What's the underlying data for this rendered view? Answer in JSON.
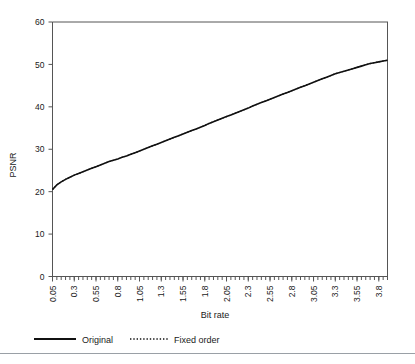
{
  "chart_data": {
    "type": "line",
    "title": "",
    "xlabel": "Bit rate",
    "ylabel": "PSNR",
    "xlim": [
      0.05,
      3.9
    ],
    "ylim": [
      0,
      60
    ],
    "ytick_values": [
      0,
      10,
      20,
      30,
      40,
      50,
      60
    ],
    "ytick_labels": [
      "0",
      "10",
      "20",
      "30",
      "40",
      "50",
      "60"
    ],
    "xtick_labels": [
      "0.05",
      "0.3",
      "0.55",
      "0.8",
      "1.05",
      "1.3",
      "1.55",
      "1.8",
      "2.05",
      "2.3",
      "2.55",
      "2.8",
      "3.05",
      "3.3",
      "3.55",
      "3.8"
    ],
    "xtick_values": [
      0.05,
      0.3,
      0.55,
      0.8,
      1.05,
      1.3,
      1.55,
      1.8,
      2.05,
      2.3,
      2.55,
      2.8,
      3.05,
      3.3,
      3.55,
      3.8
    ],
    "minor_tick_step": 0.05,
    "grid": false,
    "legend_position": "below",
    "x": [
      0.05,
      0.1,
      0.15,
      0.2,
      0.25,
      0.3,
      0.35,
      0.4,
      0.45,
      0.5,
      0.55,
      0.6,
      0.65,
      0.7,
      0.75,
      0.8,
      0.85,
      0.9,
      0.95,
      1.0,
      1.05,
      1.1,
      1.15,
      1.2,
      1.25,
      1.3,
      1.35,
      1.4,
      1.45,
      1.5,
      1.55,
      1.6,
      1.65,
      1.7,
      1.75,
      1.8,
      1.85,
      1.9,
      1.95,
      2.0,
      2.05,
      2.1,
      2.15,
      2.2,
      2.25,
      2.3,
      2.35,
      2.4,
      2.45,
      2.5,
      2.55,
      2.6,
      2.65,
      2.7,
      2.75,
      2.8,
      2.85,
      2.9,
      2.95,
      3.0,
      3.05,
      3.1,
      3.15,
      3.2,
      3.25,
      3.3,
      3.35,
      3.4,
      3.45,
      3.5,
      3.55,
      3.6,
      3.65,
      3.7,
      3.75,
      3.8,
      3.85,
      3.9
    ],
    "series": [
      {
        "name": "Original",
        "style": "solid",
        "color": "#111111",
        "values": [
          20.5,
          21.6,
          22.3,
          22.9,
          23.4,
          23.9,
          24.3,
          24.7,
          25.1,
          25.5,
          25.9,
          26.3,
          26.7,
          27.1,
          27.4,
          27.7,
          28.1,
          28.4,
          28.8,
          29.2,
          29.6,
          30.0,
          30.4,
          30.8,
          31.2,
          31.6,
          32.0,
          32.4,
          32.8,
          33.2,
          33.6,
          34.0,
          34.4,
          34.8,
          35.2,
          35.6,
          36.1,
          36.5,
          36.9,
          37.3,
          37.7,
          38.1,
          38.5,
          38.9,
          39.3,
          39.7,
          40.2,
          40.6,
          41.0,
          41.4,
          41.8,
          42.2,
          42.6,
          43.0,
          43.4,
          43.8,
          44.2,
          44.6,
          45.0,
          45.4,
          45.8,
          46.2,
          46.6,
          47.0,
          47.4,
          47.8,
          48.1,
          48.4,
          48.7,
          49.0,
          49.3,
          49.6,
          49.9,
          50.2,
          50.4,
          50.6,
          50.8,
          51.0
        ]
      },
      {
        "name": "Fixed order",
        "style": "dotted",
        "color": "#111111",
        "values": [
          20.5,
          21.6,
          22.3,
          22.9,
          23.4,
          23.9,
          24.3,
          24.7,
          25.1,
          25.5,
          25.9,
          26.3,
          26.7,
          27.1,
          27.4,
          27.7,
          28.1,
          28.4,
          28.8,
          29.2,
          29.6,
          30.0,
          30.4,
          30.8,
          31.2,
          31.6,
          32.0,
          32.4,
          32.8,
          33.2,
          33.6,
          34.0,
          34.4,
          34.8,
          35.2,
          35.6,
          36.1,
          36.5,
          36.9,
          37.3,
          37.7,
          38.1,
          38.5,
          38.9,
          39.3,
          39.7,
          40.2,
          40.6,
          41.0,
          41.4,
          41.8,
          42.2,
          42.6,
          43.0,
          43.4,
          43.8,
          44.2,
          44.6,
          45.0,
          45.4,
          45.8,
          46.2,
          46.6,
          47.0,
          47.4,
          47.8,
          48.1,
          48.4,
          48.7,
          49.0,
          49.3,
          49.6,
          49.9,
          50.2,
          50.4,
          50.6,
          50.8,
          51.0
        ]
      }
    ],
    "legend": [
      {
        "label": "Original",
        "style": "solid"
      },
      {
        "label": "Fixed order",
        "style": "dotted"
      }
    ]
  }
}
